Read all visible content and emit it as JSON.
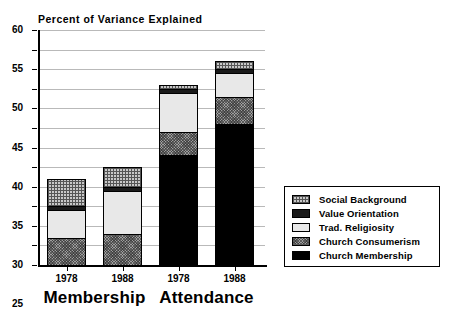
{
  "chart_data": {
    "type": "bar",
    "subtype": "stacked-bar",
    "title": "Percent of Variance Explained",
    "xlabel": "",
    "ylabel": "",
    "ylim": [
      0,
      60
    ],
    "ytick_step": 5,
    "yticks": [
      0,
      5,
      10,
      15,
      20,
      25,
      30,
      35,
      40,
      45,
      50,
      55,
      60
    ],
    "grid": true,
    "grid_axis": "y",
    "legend_position": "right",
    "categories": [
      "1978",
      "1988",
      "1978",
      "1988"
    ],
    "groups": [
      {
        "label": "Membership",
        "categories": [
          "1978",
          "1988"
        ]
      },
      {
        "label": "Attendance",
        "categories": [
          "1978",
          "1988"
        ]
      }
    ],
    "series": [
      {
        "name": "Church Membership",
        "values": [
          0,
          0,
          28,
          36
        ],
        "color": "#000000",
        "pattern": "solid-black"
      },
      {
        "name": "Church Consumerism",
        "values": [
          7,
          8,
          6,
          7
        ],
        "color": "#9e9e9e",
        "pattern": "dense-stipple"
      },
      {
        "name": "Trad. Religiosity",
        "values": [
          7,
          11,
          10,
          6
        ],
        "color": "#e8e8e8",
        "pattern": "solid-light"
      },
      {
        "name": "Value Orientation",
        "values": [
          1,
          1,
          1,
          1
        ],
        "color": "#1a1a1a",
        "pattern": "solid-dark"
      },
      {
        "name": "Social Background",
        "values": [
          7,
          5,
          1,
          2
        ],
        "color": "#c8c8c8",
        "pattern": "cross-hatch"
      }
    ],
    "totals": [
      22,
      25,
      46,
      52
    ],
    "stack_order_bottom_to_top": [
      "Church Membership",
      "Church Consumerism",
      "Trad. Religiosity",
      "Value Orientation",
      "Social Background"
    ],
    "legend_entries": [
      "Social Background",
      "Value Orientation",
      "Trad. Religiosity",
      "Church Consumerism",
      "Church Membership"
    ]
  }
}
